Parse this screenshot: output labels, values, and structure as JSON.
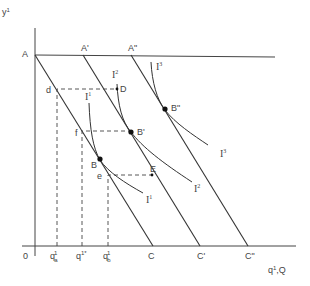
{
  "diagram": {
    "axes": {
      "y_label": "y",
      "y_label_sup": "1",
      "x_label": "q",
      "x_label_sup": "1",
      "x_label_suffix": ",Q",
      "origin": "0"
    },
    "budget_lines": [
      {
        "top": "A",
        "bottom": "C"
      },
      {
        "top": "A'",
        "bottom": "C'"
      },
      {
        "top": "A\"",
        "bottom": "C\""
      }
    ],
    "indifference_curves": [
      {
        "name": "I",
        "sup": "1"
      },
      {
        "name": "I",
        "sup": "2"
      },
      {
        "name": "I",
        "sup": "3"
      }
    ],
    "points": {
      "B": "B",
      "B_prime": "B'",
      "B_dprime": "B\"",
      "D": "D",
      "E": "E",
      "d": "d",
      "f": "f",
      "e": "e"
    },
    "x_ticks": {
      "qa": {
        "base": "q",
        "sup": "1",
        "sub": "a"
      },
      "qstar": {
        "base": "q",
        "sup": "1*"
      },
      "qb": {
        "base": "q",
        "sup": "1",
        "sub": "b"
      }
    },
    "colors": {
      "line": "#333333",
      "text": "#444444",
      "background": "#ffffff"
    }
  }
}
